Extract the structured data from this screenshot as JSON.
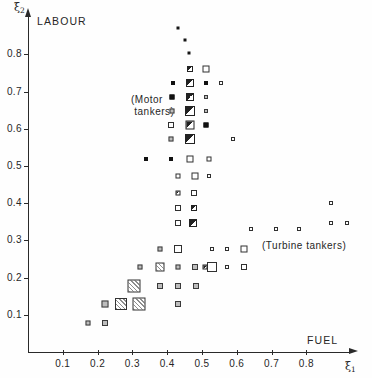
{
  "figure": {
    "y_axis_symbol": "ξ",
    "y_axis_subscript": "2",
    "x_axis_symbol": "ξ",
    "x_axis_subscript": "1",
    "y_axis_name": "LABOUR",
    "x_axis_name": "FUEL",
    "group_label_motor": "(Motor\n tankers)",
    "group_label_turbine": "(Turbine tankers)"
  },
  "chart_data": {
    "type": "scatter",
    "title": "",
    "subtitle": "",
    "xlabel": "FUEL",
    "ylabel": "LABOUR",
    "x_symbol": "ξ1",
    "y_symbol": "ξ2",
    "xlim": [
      0.0,
      0.92
    ],
    "ylim": [
      0.0,
      0.89
    ],
    "grid": false,
    "legend": "none",
    "xticks": [
      0.1,
      0.2,
      0.3,
      0.4,
      0.5,
      0.6,
      0.7,
      0.8
    ],
    "xtick_labels": [
      "0.1",
      "0.2",
      "0.3",
      "0.4",
      "0.5",
      "0.6",
      "0.7",
      "0.8"
    ],
    "yticks": [
      0.1,
      0.2,
      0.3,
      0.4,
      0.5,
      0.6,
      0.7,
      0.8
    ],
    "ytick_labels": [
      "0.1",
      "0.2",
      "0.3",
      "0.4",
      "0.5",
      "0.6",
      "0.7",
      "0.8"
    ],
    "annotations": [
      {
        "text": "LABOUR",
        "x": 0.04,
        "y": 0.86
      },
      {
        "text": "FUEL",
        "x": 0.8,
        "y": 0.05
      },
      {
        "text": "(Motor tankers)",
        "x": 0.3,
        "y": 0.66
      },
      {
        "text": "(Turbine tankers)",
        "x": 0.67,
        "y": 0.29
      }
    ],
    "marker_note": "square glyphs; fill encodes density/category: open, solid, half, hatch, grey, dot",
    "points": [
      {
        "x": 0.43,
        "y": 0.87,
        "size": 3,
        "fill": "dot"
      },
      {
        "x": 0.452,
        "y": 0.84,
        "size": 3,
        "fill": "dot"
      },
      {
        "x": 0.464,
        "y": 0.805,
        "size": 3,
        "fill": "dot"
      },
      {
        "x": 0.466,
        "y": 0.762,
        "size": 6,
        "fill": "half"
      },
      {
        "x": 0.512,
        "y": 0.762,
        "size": 7,
        "fill": "open"
      },
      {
        "x": 0.416,
        "y": 0.723,
        "size": 4,
        "fill": "solid"
      },
      {
        "x": 0.466,
        "y": 0.723,
        "size": 8,
        "fill": "half"
      },
      {
        "x": 0.512,
        "y": 0.723,
        "size": 4,
        "fill": "solid"
      },
      {
        "x": 0.556,
        "y": 0.723,
        "size": 4,
        "fill": "open"
      },
      {
        "x": 0.414,
        "y": 0.686,
        "size": 5,
        "fill": "solid"
      },
      {
        "x": 0.466,
        "y": 0.686,
        "size": 8,
        "fill": "half"
      },
      {
        "x": 0.512,
        "y": 0.686,
        "size": 4,
        "fill": "grey"
      },
      {
        "x": 0.414,
        "y": 0.648,
        "size": 5,
        "fill": "grey"
      },
      {
        "x": 0.466,
        "y": 0.648,
        "size": 10,
        "fill": "half"
      },
      {
        "x": 0.512,
        "y": 0.648,
        "size": 4,
        "fill": "grey"
      },
      {
        "x": 0.412,
        "y": 0.61,
        "size": 6,
        "fill": "open"
      },
      {
        "x": 0.466,
        "y": 0.61,
        "size": 9,
        "fill": "half"
      },
      {
        "x": 0.512,
        "y": 0.61,
        "size": 5,
        "fill": "solid"
      },
      {
        "x": 0.41,
        "y": 0.572,
        "size": 5,
        "fill": "grey"
      },
      {
        "x": 0.466,
        "y": 0.572,
        "size": 10,
        "fill": "half"
      },
      {
        "x": 0.59,
        "y": 0.572,
        "size": 4,
        "fill": "open"
      },
      {
        "x": 0.34,
        "y": 0.52,
        "size": 4,
        "fill": "solid"
      },
      {
        "x": 0.412,
        "y": 0.52,
        "size": 4,
        "fill": "solid"
      },
      {
        "x": 0.466,
        "y": 0.52,
        "size": 7,
        "fill": "open"
      },
      {
        "x": 0.52,
        "y": 0.52,
        "size": 5,
        "fill": "open"
      },
      {
        "x": 0.432,
        "y": 0.472,
        "size": 5,
        "fill": "open"
      },
      {
        "x": 0.48,
        "y": 0.472,
        "size": 7,
        "fill": "open"
      },
      {
        "x": 0.52,
        "y": 0.472,
        "size": 4,
        "fill": "open"
      },
      {
        "x": 0.43,
        "y": 0.428,
        "size": 5,
        "fill": "half"
      },
      {
        "x": 0.476,
        "y": 0.428,
        "size": 6,
        "fill": "open"
      },
      {
        "x": 0.43,
        "y": 0.386,
        "size": 6,
        "fill": "open"
      },
      {
        "x": 0.476,
        "y": 0.386,
        "size": 6,
        "fill": "half"
      },
      {
        "x": 0.43,
        "y": 0.346,
        "size": 6,
        "fill": "open"
      },
      {
        "x": 0.474,
        "y": 0.346,
        "size": 8,
        "fill": "half"
      },
      {
        "x": 0.64,
        "y": 0.33,
        "size": 4,
        "fill": "open"
      },
      {
        "x": 0.714,
        "y": 0.33,
        "size": 4,
        "fill": "open"
      },
      {
        "x": 0.78,
        "y": 0.33,
        "size": 4,
        "fill": "open"
      },
      {
        "x": 0.378,
        "y": 0.278,
        "size": 5,
        "fill": "grey"
      },
      {
        "x": 0.432,
        "y": 0.278,
        "size": 8,
        "fill": "open"
      },
      {
        "x": 0.53,
        "y": 0.278,
        "size": 4,
        "fill": "open"
      },
      {
        "x": 0.572,
        "y": 0.278,
        "size": 4,
        "fill": "open"
      },
      {
        "x": 0.62,
        "y": 0.278,
        "size": 7,
        "fill": "open"
      },
      {
        "x": 0.322,
        "y": 0.228,
        "size": 5,
        "fill": "grey"
      },
      {
        "x": 0.378,
        "y": 0.228,
        "size": 9,
        "fill": "hatch"
      },
      {
        "x": 0.432,
        "y": 0.228,
        "size": 5,
        "fill": "grey"
      },
      {
        "x": 0.48,
        "y": 0.228,
        "size": 6,
        "fill": "grey"
      },
      {
        "x": 0.53,
        "y": 0.228,
        "size": 10,
        "fill": "open"
      },
      {
        "x": 0.572,
        "y": 0.228,
        "size": 4,
        "fill": "open"
      },
      {
        "x": 0.62,
        "y": 0.228,
        "size": 6,
        "fill": "open"
      },
      {
        "x": 0.306,
        "y": 0.178,
        "size": 13,
        "fill": "hatch"
      },
      {
        "x": 0.378,
        "y": 0.178,
        "size": 6,
        "fill": "grey"
      },
      {
        "x": 0.432,
        "y": 0.178,
        "size": 6,
        "fill": "grey"
      },
      {
        "x": 0.484,
        "y": 0.178,
        "size": 6,
        "fill": "grey"
      },
      {
        "x": 0.268,
        "y": 0.128,
        "size": 12,
        "fill": "hatch"
      },
      {
        "x": 0.318,
        "y": 0.128,
        "size": 13,
        "fill": "hatch"
      },
      {
        "x": 0.222,
        "y": 0.128,
        "size": 7,
        "fill": "grey"
      },
      {
        "x": 0.432,
        "y": 0.128,
        "size": 6,
        "fill": "grey"
      },
      {
        "x": 0.172,
        "y": 0.078,
        "size": 5,
        "fill": "grey"
      },
      {
        "x": 0.222,
        "y": 0.078,
        "size": 6,
        "fill": "grey"
      },
      {
        "x": 0.508,
        "y": 0.228,
        "size": 5,
        "fill": "half"
      },
      {
        "x": 0.872,
        "y": 0.4,
        "size": 4,
        "fill": "open"
      },
      {
        "x": 0.872,
        "y": 0.348,
        "size": 4,
        "fill": "open"
      },
      {
        "x": 0.918,
        "y": 0.348,
        "size": 4,
        "fill": "open"
      }
    ]
  }
}
